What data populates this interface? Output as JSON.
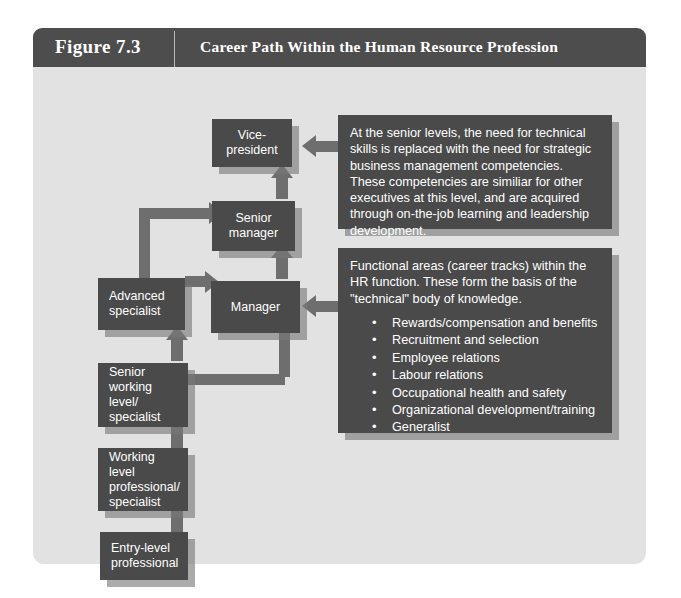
{
  "figure": {
    "number": "Figure 7.3",
    "title": "Career Path Within the Human Resource Profession"
  },
  "colors": {
    "header_bar": "#4d4d4d",
    "panel_background": "#e2e2e2",
    "node_fill": "#4a4a4a",
    "node_text": "#ffffff",
    "connector": "#6e6e6e",
    "shadow": "#787878"
  },
  "nodes": [
    {
      "id": "vice-president",
      "label": "Vice-\npresident"
    },
    {
      "id": "senior-manager",
      "label": "Senior\nmanager"
    },
    {
      "id": "manager",
      "label": "Manager"
    },
    {
      "id": "advanced-specialist",
      "label": "Advanced\nspecialist"
    },
    {
      "id": "senior-working-level",
      "label": "Senior\nworking level/\nspecialist"
    },
    {
      "id": "working-level-professional",
      "label": "Working level\nprofessional/\nspecialist"
    },
    {
      "id": "entry-level-professional",
      "label": "Entry-level\nprofessional"
    }
  ],
  "callouts": {
    "senior_levels": {
      "text": "At the senior levels, the need for technical skills is replaced with the need for strategic business management competencies. These competencies are similiar for other executives at this level, and are acquired through on-the-job learning and leadership development."
    },
    "functional_areas": {
      "text": "Functional areas (career tracks) within the HR function. These form the basis of the \"technical\"  body of knowledge.",
      "items": [
        "Rewards/compensation and benefits",
        "Recruitment and selection",
        "Employee relations",
        "Labour relations",
        "Occupational health and safety",
        "Organizational development/training",
        "Generalist"
      ]
    }
  }
}
